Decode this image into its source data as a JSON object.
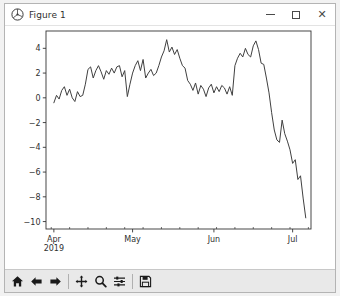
{
  "window": {
    "title": "Figure 1",
    "icon": "matplotlib-logo-icon",
    "controls": {
      "minimize_label": "–",
      "maximize_label": "□",
      "close_label": "×"
    }
  },
  "toolbar": {
    "buttons": [
      {
        "name": "home-icon",
        "tooltip": "Reset original view"
      },
      {
        "name": "back-arrow-icon",
        "tooltip": "Back to previous view"
      },
      {
        "name": "forward-arrow-icon",
        "tooltip": "Forward to next view"
      },
      {
        "name": "pan-move-icon",
        "tooltip": "Pan axes with left mouse, zoom with right"
      },
      {
        "name": "zoom-magnifier-icon",
        "tooltip": "Zoom to rectangle"
      },
      {
        "name": "configure-subplots-icon",
        "tooltip": "Configure subplots"
      },
      {
        "name": "save-floppy-icon",
        "tooltip": "Save the figure"
      }
    ]
  },
  "colors": {
    "figure_background": "#ffffff",
    "axes_background": "#ffffff",
    "line_color": "#404040",
    "spine_color": "#333333",
    "tick_label_color": "#303030",
    "toolbar_background": "#e9e9e9",
    "window_border": "#b4b4b4"
  },
  "chart_data": {
    "type": "line",
    "title": "",
    "xlabel": "",
    "ylabel": "",
    "grid": false,
    "legend": false,
    "xlim": [
      "2019-03-29",
      "2019-07-08"
    ],
    "ylim": [
      -10.6,
      5.4
    ],
    "yticks": [
      4,
      2,
      0,
      -2,
      -4,
      -6,
      -8,
      -10
    ],
    "ytick_labels": [
      "4",
      "2",
      "0",
      "−2",
      "−4",
      "−6",
      "−8",
      "−10"
    ],
    "xticks": [
      "2019-04-01",
      "2019-05-01",
      "2019-06-01",
      "2019-07-01"
    ],
    "xtick_labels": [
      "Apr",
      "May",
      "Jun",
      "Jul"
    ],
    "xtick_sublabel": "2019",
    "xminor_tick_interval_days": 7,
    "series": [
      {
        "name": "series-1",
        "color": "#404040",
        "linewidth": 1.0,
        "x": [
          "2019-04-01",
          "2019-04-02",
          "2019-04-03",
          "2019-04-04",
          "2019-04-05",
          "2019-04-06",
          "2019-04-07",
          "2019-04-08",
          "2019-04-09",
          "2019-04-10",
          "2019-04-11",
          "2019-04-12",
          "2019-04-13",
          "2019-04-14",
          "2019-04-15",
          "2019-04-16",
          "2019-04-17",
          "2019-04-18",
          "2019-04-19",
          "2019-04-20",
          "2019-04-21",
          "2019-04-22",
          "2019-04-23",
          "2019-04-24",
          "2019-04-25",
          "2019-04-26",
          "2019-04-27",
          "2019-04-28",
          "2019-04-29",
          "2019-04-30",
          "2019-05-01",
          "2019-05-02",
          "2019-05-03",
          "2019-05-04",
          "2019-05-05",
          "2019-05-06",
          "2019-05-07",
          "2019-05-08",
          "2019-05-09",
          "2019-05-10",
          "2019-05-11",
          "2019-05-12",
          "2019-05-13",
          "2019-05-14",
          "2019-05-15",
          "2019-05-16",
          "2019-05-17",
          "2019-05-18",
          "2019-05-19",
          "2019-05-20",
          "2019-05-21",
          "2019-05-22",
          "2019-05-23",
          "2019-05-24",
          "2019-05-25",
          "2019-05-26",
          "2019-05-27",
          "2019-05-28",
          "2019-05-29",
          "2019-05-30",
          "2019-05-31",
          "2019-06-01",
          "2019-06-02",
          "2019-06-03",
          "2019-06-04",
          "2019-06-05",
          "2019-06-06",
          "2019-06-07",
          "2019-06-08",
          "2019-06-09",
          "2019-06-10",
          "2019-06-11",
          "2019-06-12",
          "2019-06-13",
          "2019-06-14",
          "2019-06-15",
          "2019-06-16",
          "2019-06-17",
          "2019-06-18",
          "2019-06-19",
          "2019-06-20",
          "2019-06-21",
          "2019-06-22",
          "2019-06-23",
          "2019-06-24",
          "2019-06-25",
          "2019-06-26",
          "2019-06-27",
          "2019-06-28",
          "2019-06-29",
          "2019-06-30",
          "2019-07-01",
          "2019-07-02",
          "2019-07-03",
          "2019-07-04",
          "2019-07-05",
          "2019-07-06"
        ],
        "y": [
          -0.4,
          0.2,
          -0.1,
          0.6,
          0.9,
          0.2,
          0.7,
          0.0,
          -0.3,
          0.5,
          0.1,
          0.2,
          1.1,
          2.3,
          2.5,
          1.6,
          2.2,
          2.6,
          2.1,
          1.5,
          2.2,
          1.9,
          2.4,
          2.0,
          2.5,
          2.6,
          1.7,
          2.2,
          0.1,
          1.1,
          2.0,
          2.6,
          3.0,
          2.2,
          3.1,
          1.6,
          2.0,
          2.3,
          1.8,
          2.0,
          2.6,
          3.3,
          3.8,
          4.7,
          3.7,
          4.1,
          3.5,
          3.9,
          3.2,
          2.6,
          2.4,
          1.4,
          1.1,
          0.6,
          1.2,
          0.3,
          1.0,
          0.7,
          0.1,
          0.8,
          1.1,
          0.4,
          0.9,
          0.5,
          1.0,
          0.8,
          0.3,
          0.9,
          0.2,
          2.6,
          3.2,
          3.6,
          3.3,
          4.0,
          3.5,
          3.3,
          4.2,
          4.6,
          3.9,
          2.8,
          2.7,
          1.6,
          0.4,
          -1.2,
          -2.6,
          -3.4,
          -3.6,
          -1.8,
          -2.9,
          -3.5,
          -4.2,
          -5.3,
          -5.0,
          -6.6,
          -6.3,
          -8.1,
          -9.7
        ]
      }
    ]
  }
}
